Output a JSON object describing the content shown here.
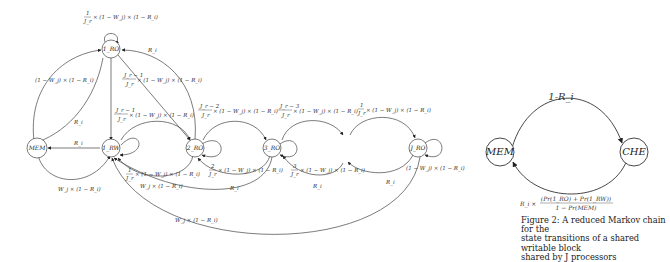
{
  "left_diagram": {
    "nodes": {
      "ro1": "1_RO",
      "mem": "MEM",
      "rw1": "1_RW",
      "ro2": "2_RO",
      "ro3": "3_RO",
      "roJ": "J_RO"
    },
    "edges": {
      "ro1_self": "1/J_r × (1−W_j) × (1−R_i)",
      "ro1_self_num": "1",
      "ro1_self_den": "J_r",
      "ro1_self_rest": "× (1 − W_j) × (1 − R_i)",
      "mem_to_ro1": "(1 − W_j) × (1 − R_i)",
      "ro1_to_mem": "R_i",
      "ro1_back_ri": "R_i",
      "ro1_to_ro2_num": "J_r − 1",
      "ro1_to_ro2_den": "J_r",
      "ro1_to_ro2_rest": "× (1 − W_j) × (1 − R_i)",
      "rw1_to_ro2_num": "J_r − 1",
      "rw1_to_ro2_den": "J_r",
      "rw1_to_ro2_rest": "× (1 − W_j) × (1 − R_i)",
      "ro2_to_ro3_num": "J_r − 2",
      "ro2_to_ro3_den": "J_r",
      "ro2_to_ro3_rest": "× (1 − W_j) × (1 − R_i)",
      "ro3_to_next_num": "J_r − 3",
      "ro3_to_next_den": "J_r",
      "ro3_to_next_rest": "× (1 − W_j) × (1 − R_i)",
      "to_roJ_num": "1",
      "to_roJ_den": "J_r",
      "to_roJ_rest": "× (1 − W_j) × (1 − R_i)",
      "rw1_to_mem": "R_i",
      "mem_to_rw1": "W_j × (1 − R_i)",
      "ro2_self_num": "1",
      "ro2_self_den": "J_r",
      "ro2_self_rest": "× (1 − W_j) × (1 − R_i)",
      "ro2_to_rw1": "W_j × (1 − R_i)",
      "ro3_self_num": "2",
      "ro3_self_den": "J_r",
      "ro3_self_rest": "× (1 − W_j) × (1 − R_i)",
      "ro3_back": "R_i",
      "next_self_num": "3",
      "next_self_den": "J_r",
      "next_self_rest": "× (1 − W_j) × (1 − R_i)",
      "next_back": "R_i",
      "roJ_self": "(1 − W_j) × (1 − R_i)",
      "roJ_back": "R_i",
      "ro3_to_rw1": "W_j × (1 − R_i)"
    }
  },
  "right_diagram": {
    "nodes": {
      "mem": "MEM",
      "che": "CHE"
    },
    "edges": {
      "mem_to_che": "1-R_i",
      "che_to_mem_prefix": "R_i ×",
      "che_to_mem_num": "(Pr(1_RO) + Pr(1_RW))",
      "che_to_mem_den": "1 − Pr(MEM)"
    }
  },
  "caption": {
    "line1": "Figure 2: A reduced Markov chain for the",
    "line2": "state transitions of a shared writable block",
    "line3": "shared by J processors"
  }
}
